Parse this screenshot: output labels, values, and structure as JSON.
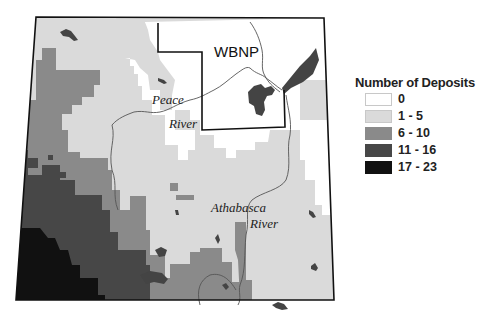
{
  "map": {
    "labels": {
      "park": "WBNP",
      "river1_line1": "Peace",
      "river1_line2": "River",
      "river2_line1": "Athabasca",
      "river2_line2": "River"
    },
    "colors": {
      "class_0": "#ffffff",
      "class_1_5": "#dadada",
      "class_6_10": "#8a8a8a",
      "class_11_16": "#474747",
      "class_17_23": "#111111",
      "water": "#444444",
      "border": "#111111",
      "river": "#555555"
    }
  },
  "legend": {
    "title": "Number of Deposits",
    "items": [
      {
        "label": "0",
        "color": "#ffffff"
      },
      {
        "label": "1 - 5",
        "color": "#dadada"
      },
      {
        "label": "6 - 10",
        "color": "#8a8a8a"
      },
      {
        "label": "11 - 16",
        "color": "#474747"
      },
      {
        "label": "17 - 23",
        "color": "#111111"
      }
    ]
  }
}
